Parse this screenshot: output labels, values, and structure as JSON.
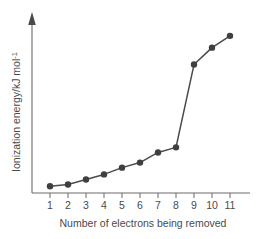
{
  "chart_data": {
    "type": "line",
    "title": "",
    "xlabel": "Number of electrons being removed",
    "ylabel": "Ionization energy/kJ mol",
    "ylabel_superscript": "-1",
    "x": [
      1,
      2,
      3,
      4,
      5,
      6,
      7,
      8,
      9,
      10,
      11
    ],
    "xtick_labels": [
      "1",
      "2",
      "3",
      "4",
      "5",
      "6",
      "7",
      "8",
      "9",
      "10",
      "11"
    ],
    "values": [
      4,
      5,
      8,
      11,
      15,
      18,
      24,
      27,
      76,
      86,
      93
    ],
    "ylim": [
      0,
      100
    ],
    "xlim": [
      0.4,
      11.6
    ],
    "ytick_labels": [],
    "grid": false,
    "legend": null,
    "series_color": "#3f3f3f",
    "axis_color": "#6b6b6b",
    "annotation": "large jump between 8 and 9",
    "marker": "filled-circle"
  },
  "figure": {
    "background": "#ffffff",
    "y_axis_has_arrow": true,
    "x_axis_has_arrow": false
  }
}
